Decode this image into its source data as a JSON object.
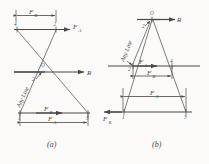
{
  "figure": {
    "background_color": "#fbfaf8",
    "ink_color": "#4a4744",
    "panels": [
      {
        "id": "a",
        "caption": "(a)",
        "labels": {
          "top_dimension": "F",
          "top_dimension_sub": "B",
          "top_force": "F",
          "top_force_sub": "A",
          "resultant": "R",
          "origin": "O",
          "any_line": "Any Line",
          "bottom_force": "F",
          "bottom_force_sub": "B",
          "bottom_dimension": "F",
          "bottom_dimension_sub": "A"
        },
        "points": {
          "top_left": "4",
          "top_right": "2",
          "center": "2",
          "bottom_left": "1",
          "bottom_right": "3"
        }
      },
      {
        "id": "b",
        "caption": "(b)",
        "labels": {
          "resultant": "R",
          "origin": "O",
          "any_line": "Any Line",
          "mid_force": "F",
          "mid_force_sub": "A",
          "mid_dimension": "F",
          "mid_dimension_sub": "B",
          "lower_dimension": "F",
          "lower_dimension_sub": "A",
          "bottom_force": "F",
          "bottom_force_sub": "B"
        },
        "points": {
          "top": "2",
          "mid_left": "2",
          "mid_right": "4",
          "bottom_left": "1",
          "bottom_right": "3"
        }
      }
    ]
  }
}
